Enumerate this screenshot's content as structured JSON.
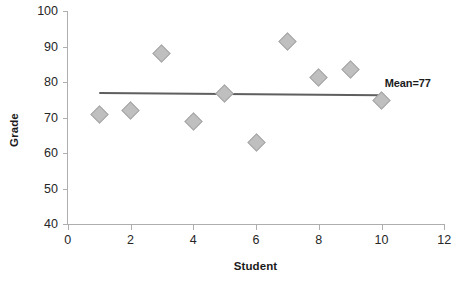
{
  "chart_data": {
    "type": "scatter",
    "title": "",
    "xlabel": "Student",
    "ylabel": "Grade",
    "xlim": [
      0,
      12
    ],
    "ylim": [
      40,
      100
    ],
    "xticks": [
      0,
      2,
      4,
      6,
      8,
      10,
      12
    ],
    "yticks": [
      40,
      50,
      60,
      70,
      80,
      90,
      100
    ],
    "grid": false,
    "legend": "none",
    "x": [
      1,
      2,
      3,
      4,
      5,
      6,
      7,
      8,
      9,
      10
    ],
    "values": [
      71,
      72,
      88,
      69,
      77,
      63,
      91.5,
      81.5,
      83.5,
      75
    ],
    "series": [
      {
        "name": "Grade",
        "marker": "diamond",
        "color": "#bfbfbf",
        "values": [
          71,
          72,
          88,
          69,
          77,
          63,
          91.5,
          81.5,
          83.5,
          75
        ]
      }
    ],
    "annotations": [
      {
        "text": "Mean=77",
        "x": 10.1,
        "y": 79.5
      }
    ],
    "reference_line": {
      "label": "Mean=77",
      "value": 77,
      "x_start": 1,
      "x_end": 10,
      "y_start": 77.3,
      "y_end": 76.7,
      "color": "#5f5f5f"
    }
  },
  "axes": {
    "y_label": "Grade",
    "x_label": "Student",
    "y_tick_labels": [
      "100",
      "90",
      "80",
      "70",
      "60",
      "50",
      "40"
    ],
    "x_tick_labels": [
      "0",
      "2",
      "4",
      "6",
      "8",
      "10",
      "12"
    ]
  },
  "colors": {
    "marker_fill": "#bfbfbf",
    "marker_stroke": "#a6a6a6",
    "mean_line": "#5f5f5f",
    "axis": "#aeaeae",
    "text": "#1b1b1b",
    "background": "#ffffff"
  }
}
